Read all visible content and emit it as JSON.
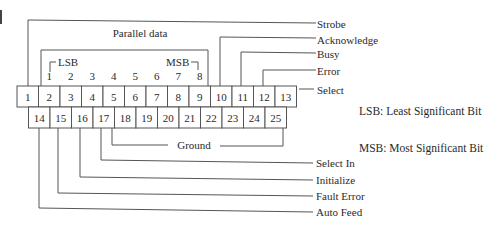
{
  "diagram": {
    "title": "Parallel data",
    "connector": {
      "top_row": [
        "1",
        "2",
        "3",
        "4",
        "5",
        "6",
        "7",
        "8",
        "9",
        "10",
        "11",
        "12",
        "13"
      ],
      "bottom_row": [
        "14",
        "15",
        "16",
        "17",
        "18",
        "19",
        "20",
        "21",
        "22",
        "23",
        "24",
        "25"
      ]
    },
    "data_bits": {
      "bits": [
        "1",
        "2",
        "3",
        "4",
        "5",
        "6",
        "7",
        "8"
      ],
      "lsb_marker": "LSB",
      "msb_marker": "MSB"
    },
    "signals_top": [
      {
        "pin": "1",
        "label": "Strobe"
      },
      {
        "pin": "10",
        "label": "Acknowledge"
      },
      {
        "pin": "11",
        "label": "Busy"
      },
      {
        "pin": "12",
        "label": "Error"
      },
      {
        "pin": "13",
        "label": "Select"
      }
    ],
    "ground": {
      "label": "Ground",
      "pins": "18-25"
    },
    "signals_bottom": [
      {
        "pin": "17",
        "label": "Select In"
      },
      {
        "pin": "16",
        "label": "Initialize"
      },
      {
        "pin": "15",
        "label": "Fault Error"
      },
      {
        "pin": "14",
        "label": "Auto Feed"
      }
    ],
    "legend": {
      "lsb": "LSB: Least Significant Bit",
      "msb": "MSB: Most Significant Bit"
    }
  }
}
